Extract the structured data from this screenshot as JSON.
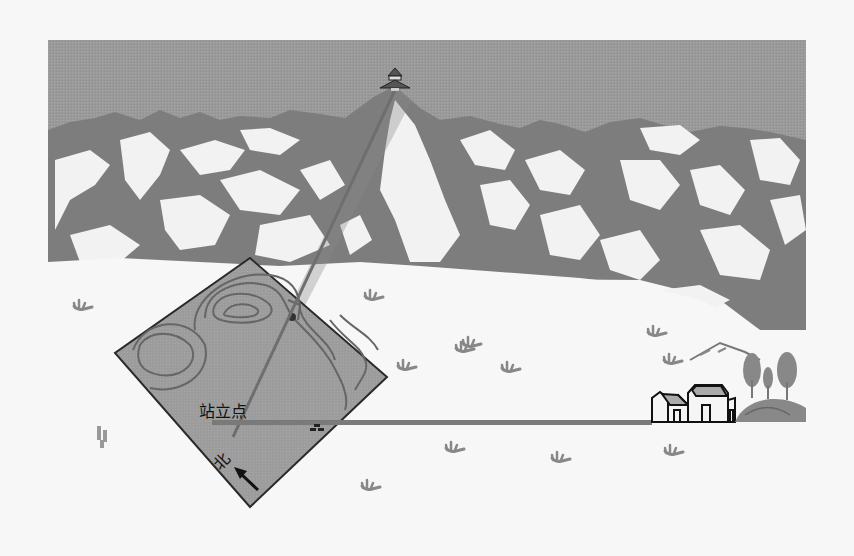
{
  "diagram": {
    "title": "",
    "labels": {
      "standpoint": "站立点",
      "north": "北"
    },
    "colors": {
      "background": "#f7f7f7",
      "sky": "#9a9a9a",
      "mountain_dark": "#7d7d7d",
      "snow": "#f2f2f2",
      "map_fill": "#9c9c9c",
      "map_outline": "#2a2a2a",
      "contour": "#666666",
      "sight_line": "#6e6e6e",
      "road": "#7a7a7a",
      "tuft": "#888888",
      "house_outline": "#111111"
    },
    "elements": {
      "summit_pavilion": {
        "x": 395,
        "y": 80
      },
      "standpoint": {
        "x": 232,
        "y": 437
      },
      "map_corners": {
        "top": [
          250,
          258
        ],
        "right": [
          387,
          377
        ],
        "bottom": [
          250,
          507
        ],
        "left": [
          115,
          353
        ]
      },
      "road": {
        "x1": 212,
        "x2": 650,
        "y": 422
      },
      "house": {
        "x": 650,
        "y": 380
      },
      "trees_hill": {
        "x": 730,
        "y": 360
      }
    }
  }
}
